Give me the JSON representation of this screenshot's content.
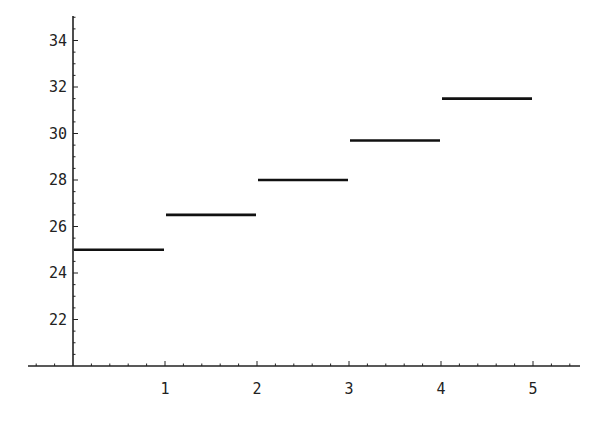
{
  "chart_data": {
    "type": "line",
    "subtype": "step-segments",
    "title": "",
    "xlabel": "",
    "ylabel": "",
    "xlim": [
      -0.5,
      5.5
    ],
    "ylim": [
      20,
      35
    ],
    "grid": false,
    "legend": null,
    "x_ticks": [
      1,
      2,
      3,
      4,
      5
    ],
    "x_tick_labels": [
      "1",
      "2",
      "3",
      "4",
      "5"
    ],
    "y_ticks": [
      22,
      24,
      26,
      28,
      30,
      32,
      34
    ],
    "y_tick_labels": [
      "22",
      "24",
      "26",
      "28",
      "30",
      "32",
      "34"
    ],
    "axis_origin": {
      "x": 0,
      "y": 20
    },
    "series": [
      {
        "name": "step",
        "segments": [
          {
            "x0": 0,
            "x1": 1,
            "y": 25.0
          },
          {
            "x0": 1,
            "x1": 2,
            "y": 26.5
          },
          {
            "x0": 2,
            "x1": 3,
            "y": 28.0
          },
          {
            "x0": 3,
            "x1": 4,
            "y": 29.7
          },
          {
            "x0": 4,
            "x1": 5,
            "y": 31.5
          }
        ]
      }
    ],
    "colors": {
      "line": "#111111",
      "axis": "#222222",
      "background": "#ffffff"
    }
  }
}
